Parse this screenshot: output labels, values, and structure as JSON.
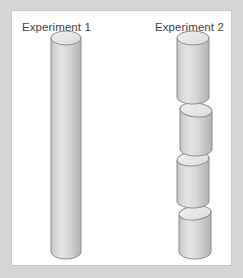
{
  "figure": {
    "title_left": "Experiment 1",
    "title_right": "Experiment 2",
    "background_color": "#d5d5d5",
    "panel_color": "#ffffff",
    "panel_border_color": "#c9c9c9",
    "label_color": "#3f3f3f"
  },
  "style": {
    "body_light": "#e2e2e2",
    "body_mid": "#d2d2d2",
    "body_dark": "#b6b6b6",
    "cap_fill": "#e9e9e9",
    "stroke": "#8c8c8c"
  },
  "specimens": [
    {
      "name": "experiment-1-cylinder",
      "label": "Experiment 1",
      "description": "single continuous intact cylinder",
      "segment_count": 1,
      "center_x": 55,
      "width": 30,
      "top_y": 28,
      "bottom_y": 248,
      "segments": [
        {
          "index": 1,
          "top_y": 28,
          "bottom_y": 248,
          "center_x": 55,
          "height": 220
        }
      ]
    },
    {
      "name": "experiment-2-cylinder",
      "label": "Experiment 2",
      "description": "cylinder broken into four stacked offset segments",
      "segment_count": 4,
      "center_x": 182,
      "width": 32,
      "top_y": 28,
      "bottom_y": 248,
      "segments": [
        {
          "index": 1,
          "top_y": 28,
          "bottom_y": 90,
          "center_x": 181,
          "height": 62
        },
        {
          "index": 2,
          "top_y": 88,
          "bottom_y": 143,
          "center_x": 184,
          "height": 55
        },
        {
          "index": 3,
          "top_y": 141,
          "bottom_y": 196,
          "center_x": 182,
          "height": 55
        },
        {
          "index": 4,
          "top_y": 194,
          "bottom_y": 248,
          "center_x": 184,
          "height": 54
        }
      ]
    }
  ]
}
